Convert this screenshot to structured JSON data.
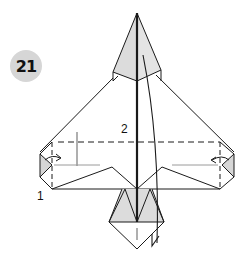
{
  "diagram": {
    "step_number": "21",
    "labels": {
      "fold_1": "1",
      "fold_2": "2"
    },
    "colors": {
      "paper_shade": "#dcdcdc",
      "line": "#1a1a1a",
      "badge": "#d6d6d6",
      "guide_line": "#9a9a9a"
    }
  }
}
